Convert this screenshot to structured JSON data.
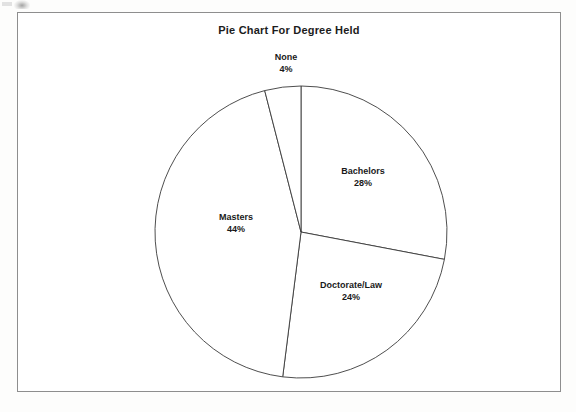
{
  "chart_data": {
    "type": "pie",
    "title": "Pie Chart For Degree Held",
    "categories": [
      "Bachelors",
      "Doctorate/Law",
      "Masters",
      "None"
    ],
    "values": [
      28,
      24,
      44,
      4
    ],
    "value_labels": [
      "28%",
      "24%",
      "44%",
      "4%"
    ],
    "units": "percent",
    "total": 100,
    "start_angle_deg": 0,
    "direction": "clockwise",
    "legend": "none",
    "grid": false,
    "slice_fill": "#ffffff",
    "slice_stroke": "#3a3a3a",
    "slices": [
      {
        "label": "Bachelors",
        "value": 28,
        "value_label": "28%",
        "label_x": 362,
        "label_y": 176
      },
      {
        "label": "Doctorate/Law",
        "value": 24,
        "value_label": "24%",
        "label_x": 350,
        "label_y": 290
      },
      {
        "label": "Masters",
        "value": 44,
        "value_label": "44%",
        "label_x": 235,
        "label_y": 222
      },
      {
        "label": "None",
        "value": 4,
        "value_label": "4%",
        "label_x": 285,
        "label_y": 62
      }
    ]
  },
  "frame": {
    "border_color": "#8e8e8e",
    "background": "#ffffff"
  },
  "geometry": {
    "center_x": 300,
    "center_y": 231,
    "radius": 146
  }
}
